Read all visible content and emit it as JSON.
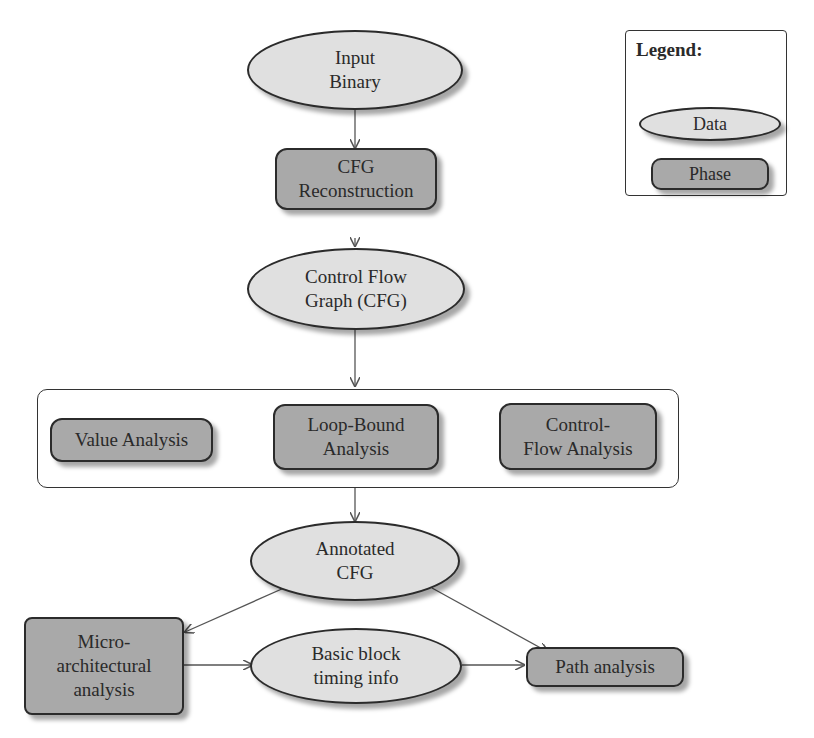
{
  "legend": {
    "title": "Legend:",
    "items": [
      {
        "label": "Data",
        "kind": "data"
      },
      {
        "label": "Phase",
        "kind": "phase"
      }
    ]
  },
  "nodes": {
    "input_binary": {
      "label": "Input\nBinary",
      "kind": "data"
    },
    "cfg_reconstruction": {
      "label": "CFG\nReconstruction",
      "kind": "phase"
    },
    "control_flow_graph": {
      "label": "Control Flow\nGraph (CFG)",
      "kind": "data"
    },
    "value_analysis": {
      "label": "Value Analysis",
      "kind": "phase"
    },
    "loop_bound_analysis": {
      "label": "Loop-Bound\nAnalysis",
      "kind": "phase"
    },
    "control_flow_analysis": {
      "label": "Control-\nFlow Analysis",
      "kind": "phase"
    },
    "annotated_cfg": {
      "label": "Annotated\nCFG",
      "kind": "data"
    },
    "microarchitectural_analysis": {
      "label": "Micro-\narchitectural\nanalysis",
      "kind": "phase"
    },
    "basic_block_timing": {
      "label": "Basic  block\ntiming  info",
      "kind": "data"
    },
    "path_analysis": {
      "label": "Path analysis",
      "kind": "phase"
    }
  },
  "edges": [
    {
      "from": "input_binary",
      "to": "cfg_reconstruction"
    },
    {
      "from": "cfg_reconstruction",
      "to": "control_flow_graph"
    },
    {
      "from": "control_flow_graph",
      "to": "analysis_group"
    },
    {
      "from": "analysis_group",
      "to": "annotated_cfg"
    },
    {
      "from": "annotated_cfg",
      "to": "microarchitectural_analysis"
    },
    {
      "from": "annotated_cfg",
      "to": "path_analysis"
    },
    {
      "from": "microarchitectural_analysis",
      "to": "basic_block_timing"
    },
    {
      "from": "basic_block_timing",
      "to": "path_analysis"
    }
  ],
  "colors": {
    "data_fill": "#e0e0e0",
    "phase_fill": "#a9a9a9",
    "stroke": "#2b2b2b",
    "edge": "#555555"
  }
}
